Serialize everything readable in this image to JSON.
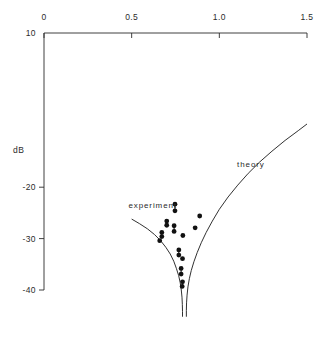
{
  "chart_data": {
    "type": "scatter",
    "title": "",
    "xlabel": "",
    "ylabel": "dB",
    "xlim": [
      0,
      1.5
    ],
    "ylim": [
      -45,
      10
    ],
    "grid": false,
    "legend_position": "inline-annotations",
    "x_axis_position": "top",
    "xticks": [
      {
        "value": 0,
        "label": "0"
      },
      {
        "value": 0.5,
        "label": "0.5"
      },
      {
        "value": 1.0,
        "label": "1.0"
      },
      {
        "value": 1.5,
        "label": "1.5"
      }
    ],
    "yticks": [
      {
        "value": 10,
        "label": "10"
      },
      {
        "value": -20,
        "label": "-20"
      },
      {
        "value": -30,
        "label": "-30"
      },
      {
        "value": -40,
        "label": "-40"
      }
    ],
    "annotations": [
      {
        "text": "experiment",
        "x": 0.62,
        "y": -23.5
      },
      {
        "text": "theory",
        "x": 1.18,
        "y": -15.5
      }
    ],
    "series": [
      {
        "name": "theory",
        "type": "line",
        "branch": "left",
        "points": [
          {
            "x": 0.5,
            "y": -26.2
          },
          {
            "x": 0.545,
            "y": -27.1
          },
          {
            "x": 0.59,
            "y": -28.1
          },
          {
            "x": 0.63,
            "y": -29.2
          },
          {
            "x": 0.665,
            "y": -30.4
          },
          {
            "x": 0.695,
            "y": -31.7
          },
          {
            "x": 0.72,
            "y": -33.0
          },
          {
            "x": 0.74,
            "y": -34.4
          },
          {
            "x": 0.755,
            "y": -35.8
          },
          {
            "x": 0.768,
            "y": -37.2
          },
          {
            "x": 0.777,
            "y": -38.6
          },
          {
            "x": 0.783,
            "y": -40.0
          },
          {
            "x": 0.787,
            "y": -41.4
          },
          {
            "x": 0.789,
            "y": -42.8
          },
          {
            "x": 0.79,
            "y": -44.2
          },
          {
            "x": 0.79,
            "y": -45.2
          }
        ]
      },
      {
        "name": "theory",
        "type": "line",
        "branch": "right",
        "points": [
          {
            "x": 0.812,
            "y": -45.2
          },
          {
            "x": 0.812,
            "y": -44.0
          },
          {
            "x": 0.813,
            "y": -42.5
          },
          {
            "x": 0.816,
            "y": -41.0
          },
          {
            "x": 0.821,
            "y": -39.4
          },
          {
            "x": 0.829,
            "y": -37.8
          },
          {
            "x": 0.84,
            "y": -36.2
          },
          {
            "x": 0.855,
            "y": -34.5
          },
          {
            "x": 0.874,
            "y": -32.7
          },
          {
            "x": 0.897,
            "y": -30.8
          },
          {
            "x": 0.925,
            "y": -28.8
          },
          {
            "x": 0.96,
            "y": -26.6
          },
          {
            "x": 1.0,
            "y": -24.3
          },
          {
            "x": 1.05,
            "y": -21.9
          },
          {
            "x": 1.105,
            "y": -19.6
          },
          {
            "x": 1.165,
            "y": -17.3
          },
          {
            "x": 1.23,
            "y": -15.1
          },
          {
            "x": 1.3,
            "y": -13.0
          },
          {
            "x": 1.375,
            "y": -10.9
          },
          {
            "x": 1.45,
            "y": -9.0
          },
          {
            "x": 1.5,
            "y": -7.7
          }
        ]
      },
      {
        "name": "experiment",
        "type": "scatter",
        "points": [
          {
            "x": 0.747,
            "y": -23.3
          },
          {
            "x": 0.747,
            "y": -24.6
          },
          {
            "x": 0.7,
            "y": -26.6
          },
          {
            "x": 0.7,
            "y": -27.4
          },
          {
            "x": 0.742,
            "y": -27.5
          },
          {
            "x": 0.742,
            "y": -28.6
          },
          {
            "x": 0.672,
            "y": -28.8
          },
          {
            "x": 0.672,
            "y": -29.6
          },
          {
            "x": 0.66,
            "y": -30.4
          },
          {
            "x": 0.792,
            "y": -29.4
          },
          {
            "x": 0.862,
            "y": -27.9
          },
          {
            "x": 0.888,
            "y": -25.6
          },
          {
            "x": 0.769,
            "y": -32.2
          },
          {
            "x": 0.769,
            "y": -33.2
          },
          {
            "x": 0.79,
            "y": -33.9
          },
          {
            "x": 0.782,
            "y": -35.8
          },
          {
            "x": 0.782,
            "y": -36.9
          },
          {
            "x": 0.79,
            "y": -38.4
          },
          {
            "x": 0.788,
            "y": -39.3
          }
        ],
        "error_bar_pairs": [
          [
            0,
            1
          ],
          [
            2,
            3
          ],
          [
            4,
            5
          ],
          [
            6,
            7
          ],
          [
            12,
            13
          ],
          [
            15,
            16
          ],
          [
            17,
            18
          ]
        ]
      }
    ]
  },
  "axes": {
    "y_title": "dB"
  }
}
